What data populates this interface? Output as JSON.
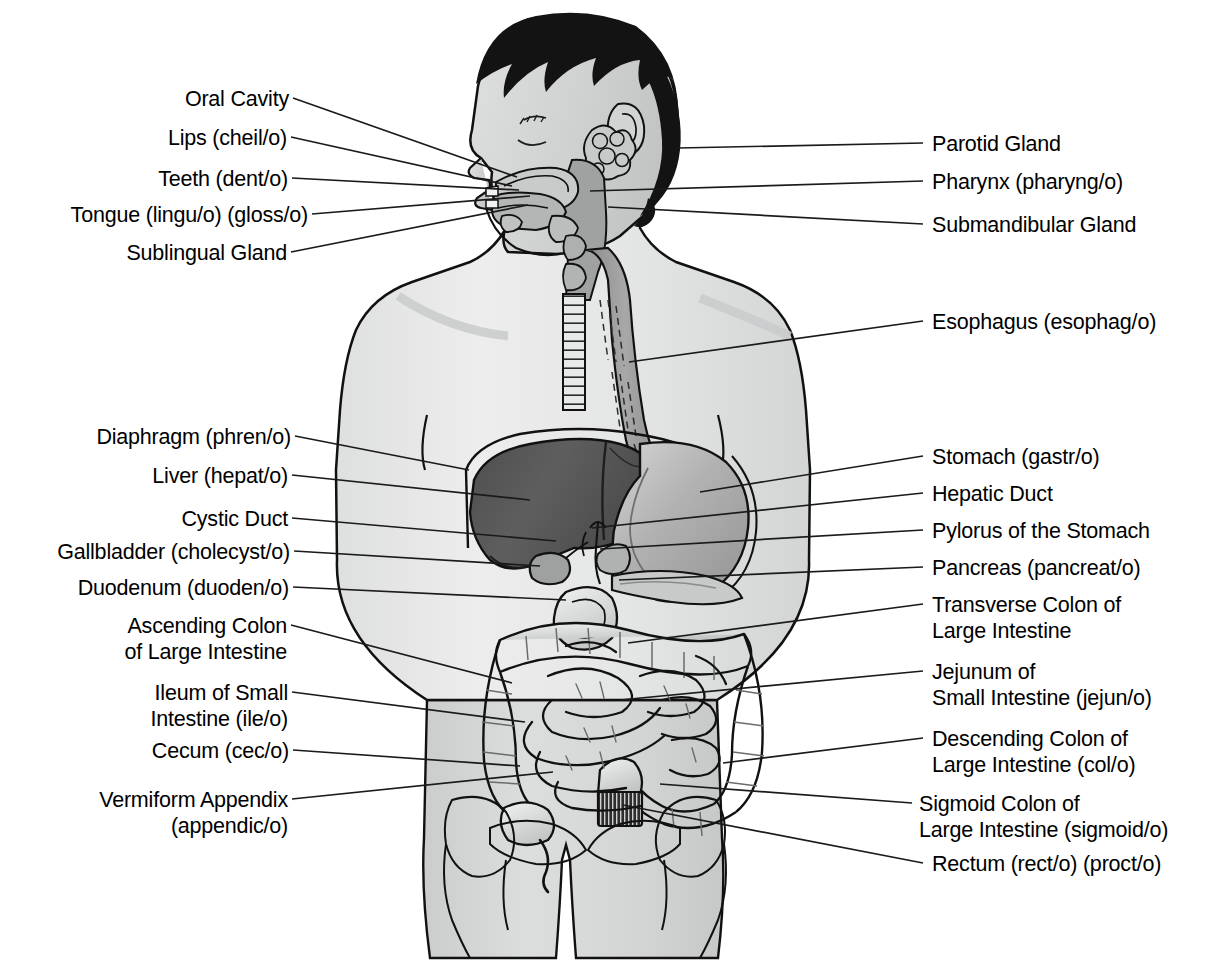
{
  "diagram": {
    "colors": {
      "background": "#ffffff",
      "text": "#000000",
      "leader_line": "#1a1a1a",
      "outline": "#111111",
      "hair": "#131313",
      "skin_upper": "#e9eaea",
      "skin_lower": "#d2d4d4",
      "liver": "#585858",
      "liver_dark": "#4a4a4a",
      "stomach": "#b6b6b6",
      "intestine": "#d8d9d9",
      "esophagus": "#9a9a9a",
      "rectum": "#2b2b2b"
    }
  },
  "labels_left": [
    {
      "id": "oral-cavity",
      "lines": [
        "Oral Cavity"
      ],
      "x": 170,
      "y": 86,
      "anchor_x": 293,
      "anchor_y": 98,
      "tip_x": 517,
      "tip_y": 177
    },
    {
      "id": "lips",
      "lines": [
        "Lips (cheil/o)"
      ],
      "x": 152,
      "y": 125,
      "anchor_x": 291,
      "anchor_y": 137,
      "tip_x": 512,
      "tip_y": 186
    },
    {
      "id": "teeth",
      "lines": [
        "Teeth (dent/o)"
      ],
      "x": 148,
      "y": 166,
      "anchor_x": 292,
      "anchor_y": 178,
      "tip_x": 519,
      "tip_y": 190
    },
    {
      "id": "tongue",
      "lines": [
        "Tongue (lingu/o) (gloss/o)"
      ],
      "x": 28,
      "y": 202,
      "anchor_x": 312,
      "anchor_y": 214,
      "tip_x": 530,
      "tip_y": 196
    },
    {
      "id": "sublingual-gland",
      "lines": [
        "Sublingual Gland"
      ],
      "x": 112,
      "y": 240,
      "anchor_x": 291,
      "anchor_y": 252,
      "tip_x": 528,
      "tip_y": 205
    },
    {
      "id": "diaphragm",
      "lines": [
        "Diaphragm (phren/o)"
      ],
      "x": 75,
      "y": 424,
      "anchor_x": 295,
      "anchor_y": 436,
      "tip_x": 469,
      "tip_y": 470
    },
    {
      "id": "liver",
      "lines": [
        "Liver (hepat/o)"
      ],
      "x": 133,
      "y": 463,
      "anchor_x": 292,
      "anchor_y": 475,
      "tip_x": 530,
      "tip_y": 500
    },
    {
      "id": "cystic-duct",
      "lines": [
        "Cystic Duct"
      ],
      "x": 167,
      "y": 506,
      "anchor_x": 292,
      "anchor_y": 518,
      "tip_x": 556,
      "tip_y": 541
    },
    {
      "id": "gallbladder",
      "lines": [
        "Gallbladder (cholecyst/o)"
      ],
      "x": 31,
      "y": 539,
      "anchor_x": 294,
      "anchor_y": 551,
      "tip_x": 540,
      "tip_y": 566
    },
    {
      "id": "duodenum",
      "lines": [
        "Duodenum (duoden/o)"
      ],
      "x": 70,
      "y": 575,
      "anchor_x": 293,
      "anchor_y": 587,
      "tip_x": 566,
      "tip_y": 600
    },
    {
      "id": "ascending-colon",
      "lines": [
        "Ascending Colon",
        "of Large Intestine"
      ],
      "x": 106,
      "y": 613,
      "anchor_x": 291,
      "anchor_y": 625,
      "tip_x": 512,
      "tip_y": 683
    },
    {
      "id": "ileum",
      "lines": [
        "Ileum of Small",
        "Intestine (ile/o)"
      ],
      "x": 130,
      "y": 680,
      "anchor_x": 292,
      "anchor_y": 692,
      "tip_x": 525,
      "tip_y": 722
    },
    {
      "id": "cecum",
      "lines": [
        "Cecum (cec/o)"
      ],
      "x": 138,
      "y": 738,
      "anchor_x": 293,
      "anchor_y": 750,
      "tip_x": 520,
      "tip_y": 766
    },
    {
      "id": "vermiform-appendix",
      "lines": [
        "Vermiform Appendix",
        "(appendic/o)"
      ],
      "x": 72,
      "y": 787,
      "anchor_x": 292,
      "anchor_y": 799,
      "tip_x": 553,
      "tip_y": 772
    }
  ],
  "labels_right": [
    {
      "id": "parotid-gland",
      "lines": [
        "Parotid Gland"
      ],
      "x": 932,
      "y": 131,
      "anchor_x": 923,
      "anchor_y": 143,
      "tip_x": 678,
      "tip_y": 148
    },
    {
      "id": "pharynx",
      "lines": [
        "Pharynx (pharyng/o)"
      ],
      "x": 932,
      "y": 169,
      "anchor_x": 923,
      "anchor_y": 181,
      "tip_x": 590,
      "tip_y": 191
    },
    {
      "id": "submandibular-gland",
      "lines": [
        "Submandibular Gland"
      ],
      "x": 932,
      "y": 212,
      "anchor_x": 923,
      "anchor_y": 224,
      "tip_x": 608,
      "tip_y": 207
    },
    {
      "id": "esophagus",
      "lines": [
        "Esophagus (esophag/o)"
      ],
      "x": 932,
      "y": 309,
      "anchor_x": 923,
      "anchor_y": 321,
      "tip_x": 629,
      "tip_y": 362
    },
    {
      "id": "stomach",
      "lines": [
        "Stomach (gastr/o)"
      ],
      "x": 932,
      "y": 444,
      "anchor_x": 923,
      "anchor_y": 456,
      "tip_x": 700,
      "tip_y": 492
    },
    {
      "id": "hepatic-duct",
      "lines": [
        "Hepatic Duct"
      ],
      "x": 932,
      "y": 481,
      "anchor_x": 923,
      "anchor_y": 493,
      "tip_x": 592,
      "tip_y": 528
    },
    {
      "id": "pylorus",
      "lines": [
        "Pylorus of the Stomach"
      ],
      "x": 932,
      "y": 518,
      "anchor_x": 923,
      "anchor_y": 530,
      "tip_x": 600,
      "tip_y": 549
    },
    {
      "id": "pancreas",
      "lines": [
        "Pancreas (pancreat/o)"
      ],
      "x": 932,
      "y": 555,
      "anchor_x": 923,
      "anchor_y": 567,
      "tip_x": 619,
      "tip_y": 580
    },
    {
      "id": "transverse-colon",
      "lines": [
        "Transverse Colon of",
        "Large Intestine"
      ],
      "x": 932,
      "y": 592,
      "anchor_x": 923,
      "anchor_y": 604,
      "tip_x": 628,
      "tip_y": 643
    },
    {
      "id": "jejunum",
      "lines": [
        "Jejunum of",
        "Small Intestine (jejun/o)"
      ],
      "x": 932,
      "y": 659,
      "anchor_x": 923,
      "anchor_y": 671,
      "tip_x": 620,
      "tip_y": 700
    },
    {
      "id": "descending-colon",
      "lines": [
        "Descending Colon of",
        "Large Intestine (col/o)"
      ],
      "x": 932,
      "y": 726,
      "anchor_x": 923,
      "anchor_y": 738,
      "tip_x": 723,
      "tip_y": 763
    },
    {
      "id": "sigmoid-colon",
      "lines": [
        "Sigmoid Colon of",
        "Large Intestine (sigmoid/o)"
      ],
      "x": 919,
      "y": 791,
      "anchor_x": 912,
      "anchor_y": 803,
      "tip_x": 660,
      "tip_y": 784
    },
    {
      "id": "rectum",
      "lines": [
        "Rectum (rect/o) (proct/o)"
      ],
      "x": 932,
      "y": 851,
      "anchor_x": 923,
      "anchor_y": 863,
      "tip_x": 623,
      "tip_y": 805
    }
  ]
}
